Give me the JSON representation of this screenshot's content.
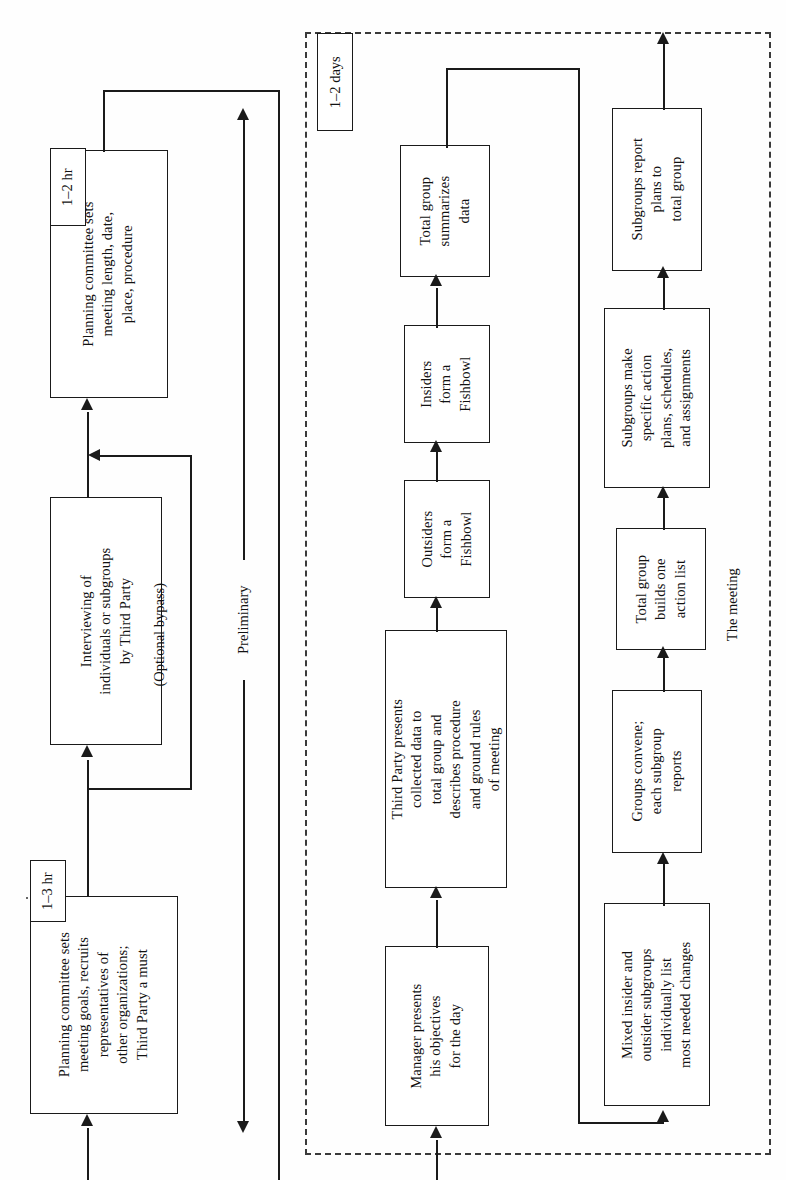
{
  "diagram": {
    "orientation": "rotated-90",
    "sections": {
      "preliminary_label": "Preliminary",
      "meeting_label": "The meeting",
      "optional_bypass_label": "(Optional bypass)"
    },
    "duration_tags": [
      {
        "id": "tag-1-3-hr",
        "text": "1–3 hr"
      },
      {
        "id": "tag-1-2-hr",
        "text": "1–2 hr"
      },
      {
        "id": "tag-1-2-days",
        "text": "1–2 days"
      }
    ],
    "nodes": [
      {
        "id": "planning-goals",
        "text": "Planning committee sets\nmeeting goals, recruits\nrepresentatives of\nother organizations;\nThird Party a must"
      },
      {
        "id": "interviewing",
        "text": "Interviewing of\nindividuals or subgroups\nby Third Party"
      },
      {
        "id": "planning-logistics",
        "text": "Planning committee sets\nmeeting length, date,\nplace, procedure"
      },
      {
        "id": "manager-objectives",
        "text": "Manager presents\nhis objectives\nfor the day"
      },
      {
        "id": "third-party-presents",
        "text": "Third Party presents\ncollected data to\ntotal group and\ndescribes procedure\nand ground rules\nof meeting"
      },
      {
        "id": "outsiders-fishbowl",
        "text": "Outsiders\nform a\nFishbowl"
      },
      {
        "id": "insiders-fishbowl",
        "text": "Insiders\nform a\nFishbowl"
      },
      {
        "id": "total-group-summarizes",
        "text": "Total group\nsummarizes\ndata"
      },
      {
        "id": "mixed-subgroups",
        "text": "Mixed insider and\noutsider subgroups\nindividually list\nmost needed changes"
      },
      {
        "id": "groups-convene",
        "text": "Groups convene;\neach subgroup\nreports"
      },
      {
        "id": "total-group-action-list",
        "text": "Total group\nbuilds one\naction list"
      },
      {
        "id": "subgroups-action-plans",
        "text": "Subgroups make\nspecific action\nplans, schedules,\nand assignments"
      },
      {
        "id": "subgroups-report",
        "text": "Subgroups report\nplans to\ntotal group"
      }
    ],
    "colors": {
      "stroke": "#1a1a1a",
      "dashed_stroke": "#3a3a3a",
      "background": "#ffffff"
    }
  }
}
